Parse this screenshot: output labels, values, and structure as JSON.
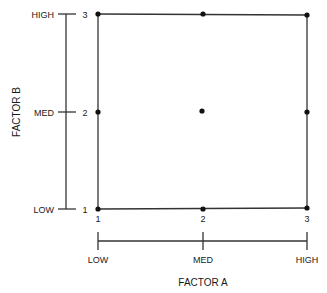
{
  "diagram": {
    "type": "3x3 factorial design grid",
    "factor_a": {
      "title": "FACTOR A",
      "levels": [
        {
          "code": "1",
          "label": "LOW"
        },
        {
          "code": "2",
          "label": "MED"
        },
        {
          "code": "3",
          "label": "HIGH"
        }
      ]
    },
    "factor_b": {
      "title": "FACTOR B",
      "levels": [
        {
          "code": "1",
          "label": "LOW"
        },
        {
          "code": "2",
          "label": "MED"
        },
        {
          "code": "3",
          "label": "HIGH"
        }
      ]
    },
    "design_points": [
      {
        "a": 1,
        "b": 1
      },
      {
        "a": 2,
        "b": 1
      },
      {
        "a": 3,
        "b": 1
      },
      {
        "a": 1,
        "b": 2
      },
      {
        "a": 2,
        "b": 2
      },
      {
        "a": 3,
        "b": 2
      },
      {
        "a": 1,
        "b": 3
      },
      {
        "a": 2,
        "b": 3
      },
      {
        "a": 3,
        "b": 3
      }
    ],
    "colors": {
      "line": "#333333",
      "dot": "#111111",
      "text": "#1a1a1a",
      "background": "#ffffff"
    }
  }
}
